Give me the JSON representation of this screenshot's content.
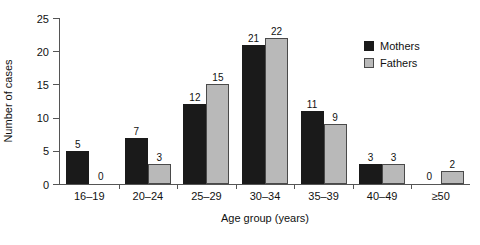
{
  "chart_data": {
    "type": "bar",
    "title": "",
    "xlabel": "Age group (years)",
    "ylabel": "Number of cases",
    "categories": [
      "16–19",
      "20–24",
      "25–29",
      "30–34",
      "35–39",
      "40–49",
      "≥50"
    ],
    "series": [
      {
        "name": "Mothers",
        "color": "#1a1a1a",
        "values": [
          5,
          7,
          12,
          21,
          11,
          3,
          0
        ]
      },
      {
        "name": "Fathers",
        "color": "#b9b9b9",
        "values": [
          0,
          3,
          15,
          22,
          9,
          3,
          2
        ]
      }
    ],
    "ylim": [
      0,
      25
    ],
    "yticks": [
      0,
      5,
      10,
      15,
      20,
      25
    ],
    "ytick_labels": [
      "0",
      "5",
      "10",
      "15",
      "20",
      "25"
    ],
    "grid": false,
    "legend_position": "top-right",
    "data_labels": true
  },
  "legend": {
    "items": [
      {
        "label": "Mothers"
      },
      {
        "label": "Fathers"
      }
    ]
  }
}
